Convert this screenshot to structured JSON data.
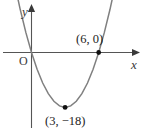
{
  "figure": {
    "background_color": "#ffffff",
    "width": 144,
    "height": 131,
    "axes": {
      "color": "#555555",
      "x_axis_label": "x",
      "y_axis_label": "y",
      "origin_label": "O"
    },
    "curve": {
      "color": "#808080",
      "point_marker_color": "#111111"
    },
    "labels": {
      "root": "(6, 0)",
      "vertex": "(3, −18)"
    }
  },
  "chart_data": {
    "type": "line",
    "title": "",
    "xlabel": "x",
    "ylabel": "y",
    "subtitle": "",
    "grid": false,
    "legend": null,
    "xlim": [
      -1.4,
      7.6
    ],
    "ylim": [
      -24,
      14
    ],
    "curve_equation": "y = 2(x - 3)^2 - 18",
    "annotations": [
      {
        "label": "(6, 0)",
        "x": 6,
        "y": 0,
        "marker": true
      },
      {
        "label": "(3, −18)",
        "x": 3,
        "y": -18,
        "marker": true
      },
      {
        "label": "O",
        "x": 0,
        "y": 0,
        "marker": false
      }
    ],
    "series": [
      {
        "name": "parabola",
        "x": [
          -1.4,
          -1.0,
          -0.5,
          0.0,
          0.5,
          1.0,
          1.5,
          2.0,
          2.5,
          3.0,
          3.5,
          4.0,
          4.5,
          5.0,
          5.5,
          6.0,
          6.5,
          7.0,
          7.4
        ],
        "values": [
          20.7,
          14,
          6.5,
          0,
          -5.5,
          -10,
          -13.5,
          -16,
          -17.5,
          -18,
          -17.5,
          -16,
          -13.5,
          -10,
          -5.5,
          0,
          6.5,
          14,
          20.7
        ]
      }
    ]
  }
}
